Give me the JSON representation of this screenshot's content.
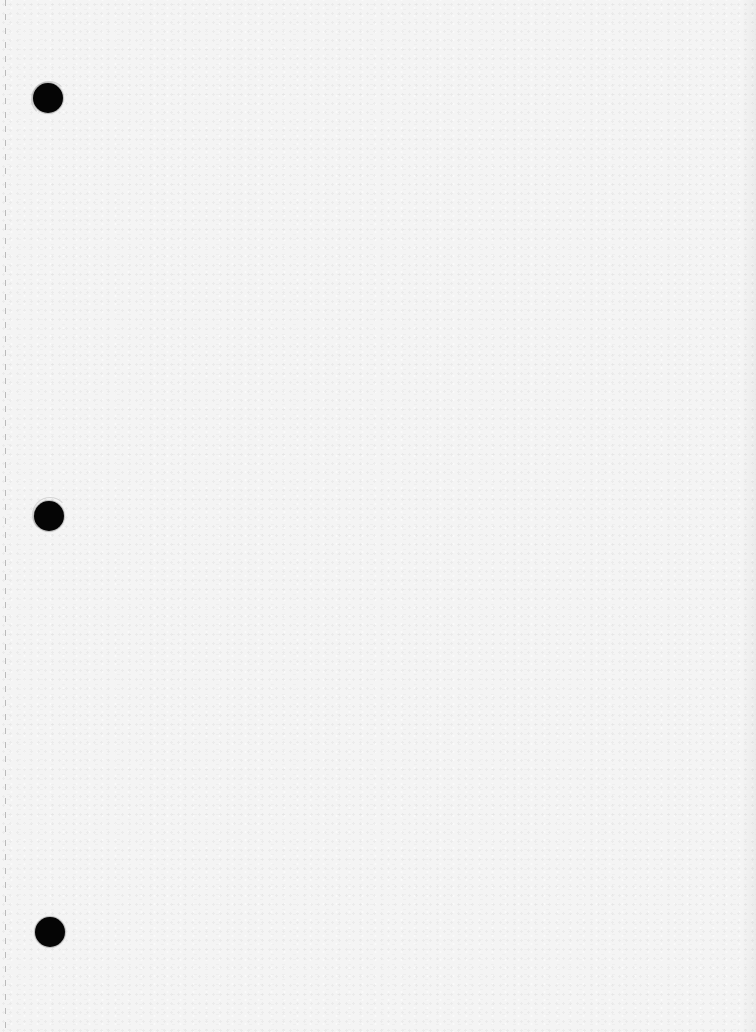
{
  "page": {
    "type": "blank-hole-punched-sheet",
    "background_color": "#f4f4f4",
    "text_content": []
  },
  "punch_holes": [
    {
      "name": "punch-hole-top",
      "cx": 48,
      "cy": 98,
      "diameter": 30,
      "color": "#050505"
    },
    {
      "name": "punch-hole-middle",
      "cx": 49,
      "cy": 516,
      "diameter": 30,
      "color": "#050505"
    },
    {
      "name": "punch-hole-bottom",
      "cx": 50,
      "cy": 932,
      "diameter": 30,
      "color": "#050505"
    }
  ],
  "perforation_line": {
    "x": 5,
    "style": "dashed",
    "color": "#8a8a8a"
  }
}
